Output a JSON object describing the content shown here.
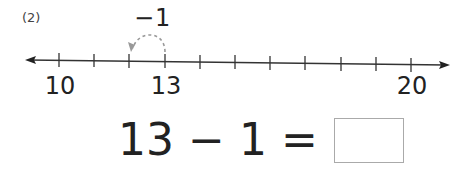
{
  "problem": {
    "number_label": "(2)",
    "hop_label": "−1",
    "number_line": {
      "min": 10,
      "max": 20,
      "labels": [
        {
          "value": 10,
          "text": "10"
        },
        {
          "value": 13,
          "text": "13"
        },
        {
          "value": 20,
          "text": "20"
        }
      ],
      "hop": {
        "from": 13,
        "to": 12,
        "style": "dashed"
      }
    },
    "equation": {
      "left": "13",
      "operator": "−",
      "right": "1",
      "equals": "=",
      "answer": ""
    }
  }
}
